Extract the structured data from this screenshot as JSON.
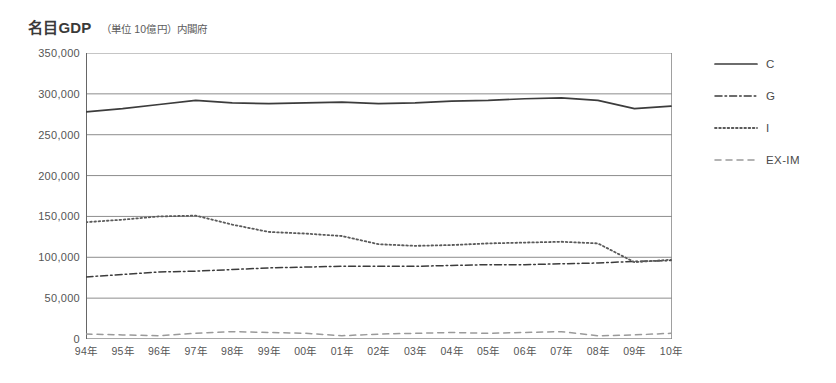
{
  "header": {
    "title_main": "名目GDP",
    "title_sub": "（単位 10億円）内閣府"
  },
  "legend": {
    "position": "right",
    "items": [
      {
        "label": "C",
        "style": "solid",
        "color": "#3c3c3c"
      },
      {
        "label": "G",
        "style": "dashdot",
        "color": "#3c3c3c"
      },
      {
        "label": "I",
        "style": "dotted",
        "color": "#5a5a5a"
      },
      {
        "label": "EX-IM",
        "style": "dashed",
        "color": "#9a9a9a"
      }
    ]
  },
  "chart_data": {
    "type": "line",
    "title": "名目GDP",
    "subtitle": "（単位 10億円）内閣府",
    "xlabel": "",
    "ylabel": "",
    "ylim": [
      0,
      350000
    ],
    "ytick_step": 50000,
    "grid": true,
    "legend_position": "right",
    "categories": [
      "94年",
      "95年",
      "96年",
      "97年",
      "98年",
      "99年",
      "00年",
      "01年",
      "02年",
      "03年",
      "04年",
      "05年",
      "06年",
      "07年",
      "08年",
      "09年",
      "10年"
    ],
    "ytick_labels": [
      "0",
      "50,000",
      "100,000",
      "150,000",
      "200,000",
      "250,000",
      "300,000",
      "350,000"
    ],
    "ytick_values": [
      0,
      50000,
      100000,
      150000,
      200000,
      250000,
      300000,
      350000
    ],
    "series": [
      {
        "name": "C",
        "style": "solid",
        "color": "#3c3c3c",
        "values": [
          278000,
          282000,
          287000,
          292000,
          289000,
          288000,
          289000,
          290000,
          288000,
          289000,
          291000,
          292000,
          294000,
          295000,
          292000,
          282000,
          285000
        ]
      },
      {
        "name": "G",
        "style": "dashdot",
        "color": "#3c3c3c",
        "values": [
          76000,
          79000,
          82000,
          83000,
          85000,
          87000,
          88000,
          89000,
          89000,
          89000,
          90000,
          91000,
          91000,
          92000,
          93000,
          95000,
          96000
        ]
      },
      {
        "name": "I",
        "style": "dotted",
        "color": "#5a5a5a",
        "values": [
          143000,
          146000,
          150000,
          151000,
          140000,
          131000,
          129000,
          126000,
          116000,
          114000,
          115000,
          117000,
          118000,
          119000,
          117000,
          94000,
          97000
        ]
      },
      {
        "name": "EX-IM",
        "style": "dashed",
        "color": "#9a9a9a",
        "values": [
          6000,
          5000,
          4000,
          7000,
          9000,
          8000,
          7000,
          4000,
          6000,
          7000,
          8000,
          7000,
          8000,
          9000,
          4000,
          5000,
          7000
        ]
      }
    ]
  }
}
